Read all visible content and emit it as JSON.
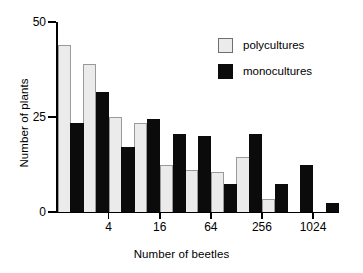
{
  "chart_data": {
    "type": "bar",
    "title": "",
    "subtitle": "",
    "xlabel": "Number of beetles",
    "ylabel": "Number of plants",
    "ylim": [
      0,
      50
    ],
    "yticks": [
      0,
      25,
      50
    ],
    "ytick_labels": [
      "0",
      "25",
      "50"
    ],
    "xtick_labels": [
      "4",
      "16",
      "64",
      "256",
      "1024"
    ],
    "xscale": "log4",
    "grid": false,
    "legend_position": "top-right",
    "bin_count": 11,
    "series": [
      {
        "name": "polycultures",
        "color": "#ebebeb",
        "edge_color": "#9a9a9a",
        "values": [
          44,
          39,
          25,
          23.5,
          12.5,
          11,
          10.5,
          14.5,
          3.5,
          0,
          0
        ]
      },
      {
        "name": "monocultures",
        "color": "#0b0b0b",
        "edge_color": "#0b0b0b",
        "values": [
          23.5,
          31.5,
          17,
          24.5,
          20.5,
          20,
          7.5,
          20.5,
          7.5,
          12.5,
          2.5
        ]
      }
    ]
  },
  "legend": {
    "entries": [
      {
        "label": "polycultures",
        "swatch": "light-gray-square"
      },
      {
        "label": "monocultures",
        "swatch": "black-square"
      }
    ]
  }
}
